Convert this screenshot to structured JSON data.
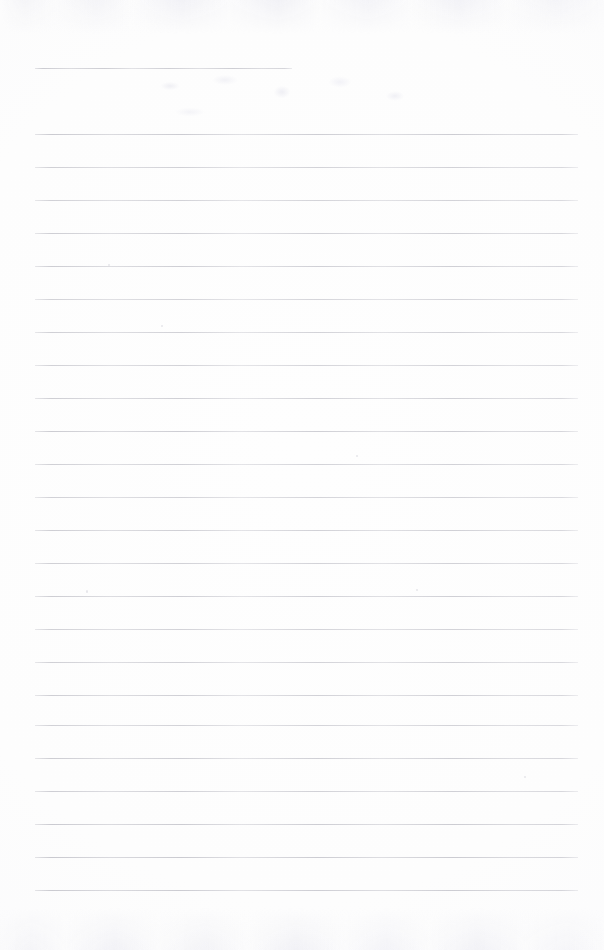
{
  "document": {
    "title": "Blank Lined Notebook Page",
    "kind": "scanned-ruled-paper",
    "page_width": 604,
    "page_height": 950,
    "background_color": "#fdfdfd",
    "rule_color": "#bdbdc5",
    "text_content": "",
    "has_handwriting": false,
    "notes": "Empty ruled page from a scanned notebook; no text or figures present."
  },
  "ruling": {
    "line_count": 26,
    "line_spacing_px": 33,
    "left_margin_px": 35,
    "right_edge_px": 578,
    "first_line_y_px": 68,
    "first_line_right_edge_px": 292,
    "body_first_line_y_px": 134,
    "last_line_y_px": 890,
    "lines": [
      {
        "index": 1,
        "y": 68,
        "x1": 35,
        "x2": 292,
        "opacity": 0.78
      },
      {
        "index": 2,
        "y": 134,
        "x1": 35,
        "x2": 578,
        "opacity": 0.8
      },
      {
        "index": 3,
        "y": 167,
        "x1": 35,
        "x2": 578,
        "opacity": 0.72
      },
      {
        "index": 4,
        "y": 200,
        "x1": 35,
        "x2": 578,
        "opacity": 0.7
      },
      {
        "index": 5,
        "y": 233,
        "x1": 35,
        "x2": 578,
        "opacity": 0.74
      },
      {
        "index": 6,
        "y": 266,
        "x1": 35,
        "x2": 578,
        "opacity": 0.76
      },
      {
        "index": 7,
        "y": 299,
        "x1": 35,
        "x2": 578,
        "opacity": 0.68
      },
      {
        "index": 8,
        "y": 332,
        "x1": 35,
        "x2": 578,
        "opacity": 0.72
      },
      {
        "index": 9,
        "y": 365,
        "x1": 35,
        "x2": 578,
        "opacity": 0.7
      },
      {
        "index": 10,
        "y": 398,
        "x1": 35,
        "x2": 578,
        "opacity": 0.74
      },
      {
        "index": 11,
        "y": 431,
        "x1": 35,
        "x2": 578,
        "opacity": 0.78
      },
      {
        "index": 12,
        "y": 464,
        "x1": 35,
        "x2": 578,
        "opacity": 0.72
      },
      {
        "index": 13,
        "y": 497,
        "x1": 35,
        "x2": 578,
        "opacity": 0.7
      },
      {
        "index": 14,
        "y": 530,
        "x1": 35,
        "x2": 578,
        "opacity": 0.74
      },
      {
        "index": 15,
        "y": 563,
        "x1": 35,
        "x2": 578,
        "opacity": 0.72
      },
      {
        "index": 16,
        "y": 596,
        "x1": 35,
        "x2": 578,
        "opacity": 0.76
      },
      {
        "index": 17,
        "y": 629,
        "x1": 35,
        "x2": 578,
        "opacity": 0.7
      },
      {
        "index": 18,
        "y": 662,
        "x1": 35,
        "x2": 578,
        "opacity": 0.72
      },
      {
        "index": 19,
        "y": 695,
        "x1": 35,
        "x2": 578,
        "opacity": 0.74
      },
      {
        "index": 20,
        "y": 725,
        "x1": 35,
        "x2": 578,
        "opacity": 0.7
      },
      {
        "index": 21,
        "y": 758,
        "x1": 35,
        "x2": 578,
        "opacity": 0.76
      },
      {
        "index": 22,
        "y": 791,
        "x1": 35,
        "x2": 578,
        "opacity": 0.74
      },
      {
        "index": 23,
        "y": 824,
        "x1": 35,
        "x2": 578,
        "opacity": 0.8
      },
      {
        "index": 24,
        "y": 857,
        "x1": 35,
        "x2": 578,
        "opacity": 0.82
      },
      {
        "index": 25,
        "y": 890,
        "x1": 35,
        "x2": 578,
        "opacity": 0.8
      }
    ]
  },
  "artifacts": {
    "specks": [
      {
        "x": 86,
        "y": 590,
        "w": 2,
        "h": 3
      },
      {
        "x": 161,
        "y": 325,
        "w": 2,
        "h": 2
      },
      {
        "x": 356,
        "y": 455,
        "w": 2,
        "h": 2
      },
      {
        "x": 416,
        "y": 589,
        "w": 2,
        "h": 2
      },
      {
        "x": 524,
        "y": 776,
        "w": 2,
        "h": 2
      },
      {
        "x": 108,
        "y": 264,
        "w": 2,
        "h": 2
      }
    ],
    "bleed_through_top": true,
    "bleed_through_bottom": true
  }
}
